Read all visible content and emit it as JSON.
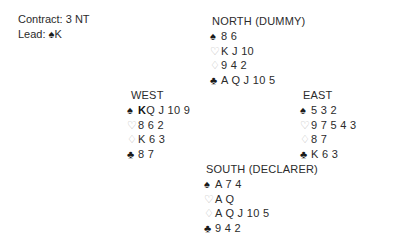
{
  "header": {
    "contract_label": "Contract:",
    "contract_value": "3 NT",
    "lead_label": "Lead:",
    "lead_suit_symbol": "♠",
    "lead_card": "K"
  },
  "suit_symbols": {
    "spade": "♠",
    "heart": "♡",
    "diamond": "♢",
    "club": "♣"
  },
  "colors": {
    "solid_suit": "#1a1a1a",
    "hollow_suit": "#b9b9b9",
    "text": "#2b2b2b",
    "background": "#ffffff"
  },
  "hands": {
    "north": {
      "label": "NORTH (DUMMY)",
      "spades": "8 6",
      "hearts": "K J 10",
      "diamonds": "9 4 2",
      "clubs": "A Q J 10 5"
    },
    "west": {
      "label": "WEST",
      "spades_lead": "K",
      "spades_rest": "Q J 10 9",
      "hearts": "8 6 2",
      "diamonds": "K 6 3",
      "clubs": "8 7"
    },
    "east": {
      "label": "EAST",
      "spades": "5 3 2",
      "hearts": "9 7 5 4 3",
      "diamonds": "8 7",
      "clubs": "K 6 3"
    },
    "south": {
      "label": "SOUTH (DECLARER)",
      "spades": "A 7 4",
      "hearts": "A Q",
      "diamonds": "A Q J 10 5",
      "clubs": "9 4 2"
    }
  }
}
